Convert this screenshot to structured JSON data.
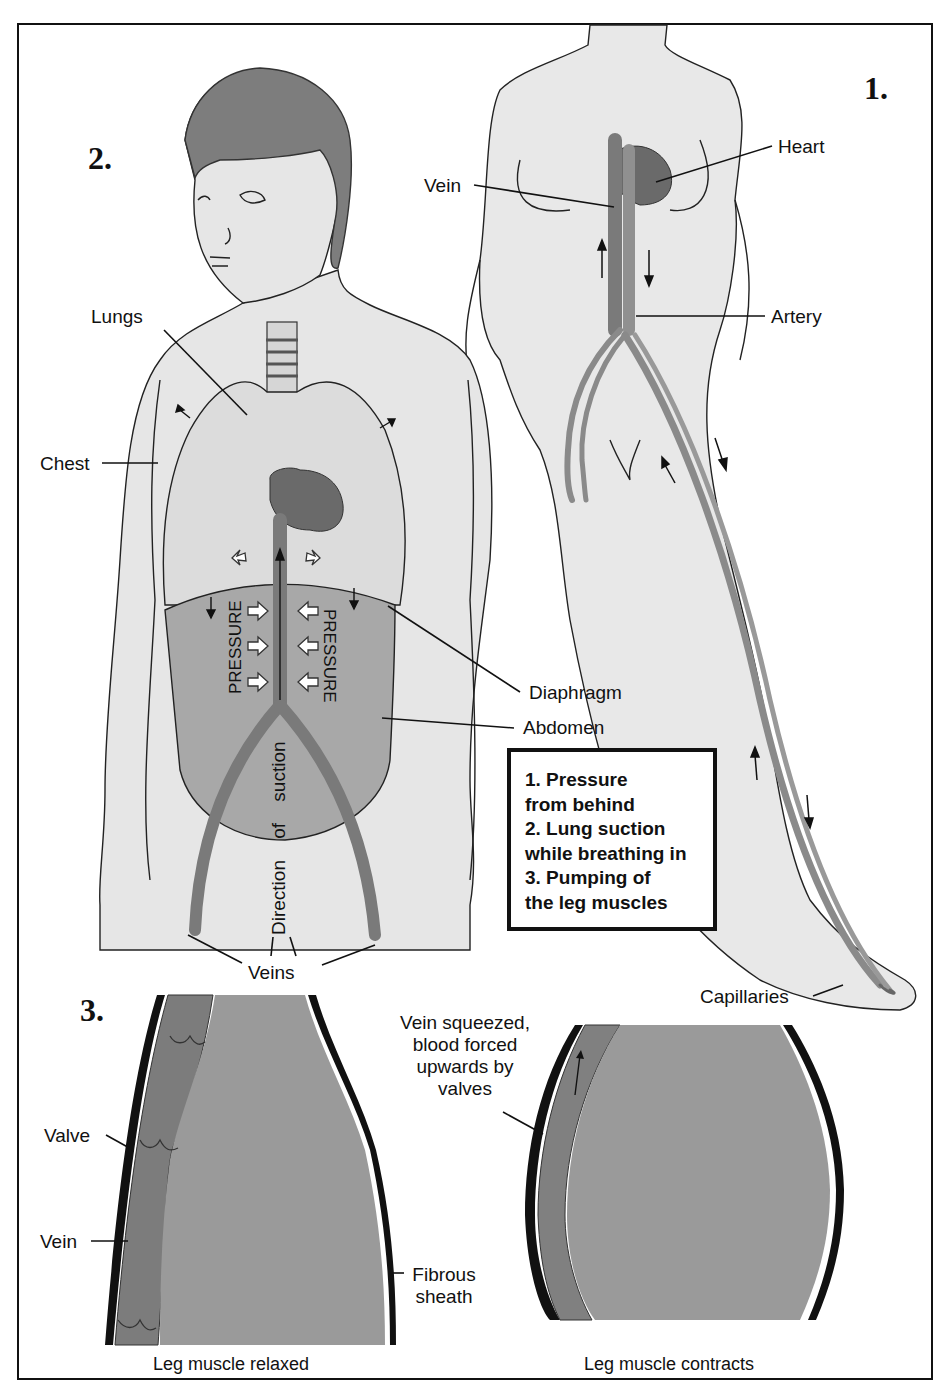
{
  "figure": {
    "panels": [
      {
        "number": "1.",
        "title_hint": "Pressure from behind"
      },
      {
        "number": "2.",
        "title_hint": "Lung suction while breathing in"
      },
      {
        "number": "3.",
        "title_hint": "Pumping of the leg muscles"
      }
    ],
    "panel1_labels": {
      "heart": "Heart",
      "vein": "Vein",
      "artery": "Artery",
      "capillaries": "Capillaries"
    },
    "panel2_labels": {
      "lungs": "Lungs",
      "chest": "Chest",
      "diaphragm": "Diaphragm",
      "abdomen": "Abdomen",
      "veins": "Veins",
      "pressure_left": "PRESSURE",
      "pressure_right": "PRESSURE",
      "direction": "Direction of suction"
    },
    "legend": {
      "lines": [
        "1.  Pressure",
        "from behind",
        "2.  Lung suction",
        "while breathing in",
        "3.  Pumping of",
        "the leg muscles"
      ]
    },
    "panel3_labels": {
      "valve": "Valve",
      "vein": "Vein",
      "fibrous_line1": "Fibrous",
      "fibrous_line2": "sheath",
      "squeezed_lines": [
        "Vein squeezed,",
        "blood forced",
        "upwards by",
        "valves"
      ],
      "caption_relaxed": "Leg muscle relaxed",
      "caption_contracts": "Leg muscle contracts"
    },
    "colors": {
      "skin": "#e6e6e6",
      "hair": "#7d7d7d",
      "organ_dark": "#6e6e6e",
      "vessel": "#8a8a8a",
      "abdomen": "#a8a8a8",
      "muscle": "#9a9a9a",
      "vein_dark": "#777777",
      "line": "#111111"
    }
  }
}
